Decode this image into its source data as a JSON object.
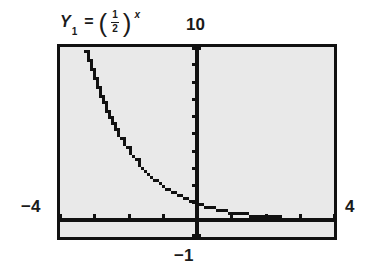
{
  "figure": {
    "kind": "graphing-calculator-screen",
    "background_color": "#ffffff",
    "screen_fill_color": "#e9e9e9",
    "ink_color": "#111111"
  },
  "labels": {
    "function_y": "Y",
    "function_subscript": "1",
    "function_equals": "=",
    "function_paren_open": "(",
    "function_numerator": "1",
    "function_denominator": "2",
    "function_paren_close": ")",
    "function_exponent": "x",
    "function_plain": "Y1 = (1/2)^x",
    "top": "10",
    "left": "−4",
    "right": "4",
    "bottom": "−1"
  },
  "chart_data": {
    "type": "line",
    "xlabel": "",
    "ylabel": "",
    "xlim": [
      -4,
      4
    ],
    "ylim": [
      -1,
      10
    ],
    "xtick_interval": 1,
    "ytick_interval": 1,
    "grid": false,
    "legend": "none",
    "axis_labels": {
      "xmin": "−4",
      "xmax": "4",
      "ymin": "−1",
      "ymax": "10"
    },
    "series": [
      {
        "name": "Y1 = (1/2)^x",
        "equation": "y = (1/2)^x",
        "style": "pixelated-stair-step",
        "x": [
          -3.32,
          -3.2,
          -3.0,
          -2.8,
          -2.6,
          -2.4,
          -2.2,
          -2.0,
          -1.8,
          -1.6,
          -1.4,
          -1.2,
          -1.0,
          -0.8,
          -0.6,
          -0.4,
          -0.2,
          0.0,
          0.25,
          0.5,
          0.75,
          1.0,
          1.25,
          1.5,
          1.75,
          2.0,
          2.25,
          2.5,
          3.0,
          3.5,
          4.0
        ],
        "y": [
          9.98,
          9.19,
          8.0,
          6.96,
          6.06,
          5.28,
          4.59,
          4.0,
          3.48,
          3.03,
          2.64,
          2.3,
          2.0,
          1.74,
          1.52,
          1.32,
          1.15,
          1.0,
          0.84,
          0.71,
          0.59,
          0.5,
          0.42,
          0.35,
          0.3,
          0.25,
          0.21,
          0.18,
          0.125,
          0.088,
          0.0625
        ]
      }
    ],
    "annotations": [
      {
        "text": "y-axis drawn as vertical line at x = 0 with unit tick marks"
      },
      {
        "text": "x-axis drawn as thick horizontal line at y = 0 with unit tick marks"
      },
      {
        "text": "curve decays toward the x-axis asymptote as x increases"
      }
    ]
  }
}
